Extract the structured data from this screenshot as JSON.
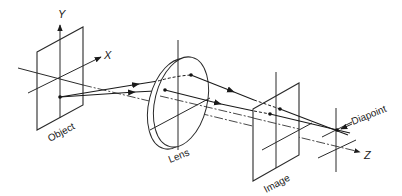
{
  "diagram": {
    "axes": {
      "x_label": "X",
      "y_label": "Y",
      "z_label": "Z"
    },
    "labels": {
      "object": "Object",
      "lens": "Lens",
      "image": "Image",
      "diapoint": "Diapoint"
    },
    "colors": {
      "line": "#2a2a2a",
      "background": "#ffffff"
    }
  }
}
